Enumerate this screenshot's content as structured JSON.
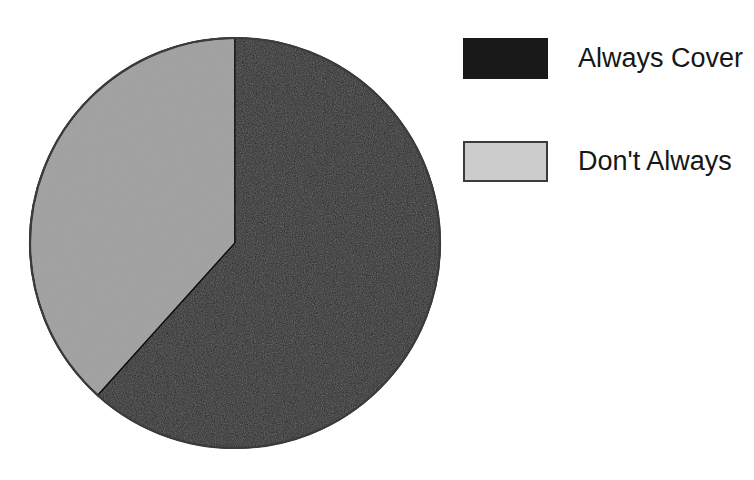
{
  "figure": {
    "background": "#ffffff",
    "width": 754,
    "height": 480
  },
  "chart_data": {
    "type": "pie",
    "title": "",
    "subtitle": "",
    "xlabel": "",
    "ylabel": "",
    "grid": false,
    "legend_position": "right",
    "categories": [
      "Always Cover",
      "Don't Always"
    ],
    "values": [
      61.7,
      38.3
    ],
    "units": "percent",
    "start_angle_deg": 0,
    "direction": "clockwise",
    "slices": [
      {
        "label": "Always Cover",
        "value": 61.7,
        "color": "#191919",
        "start_angle_deg": 0,
        "end_angle_deg": 222,
        "sweep_deg": 222
      },
      {
        "label": "Don't Always",
        "value": 38.3,
        "color": "#cccccc",
        "start_angle_deg": 222,
        "end_angle_deg": 360,
        "sweep_deg": 138
      }
    ],
    "geometry": {
      "center_x": 235,
      "center_y": 243,
      "radius": 205,
      "outline_color": "#3b3b3b"
    }
  },
  "legend": {
    "items": [
      {
        "label": "Always Cover",
        "swatch_name": "legend-swatch-always-cover",
        "color": "#191919",
        "style": "dark"
      },
      {
        "label": "Don't Always",
        "swatch_name": "legend-swatch-dont-always",
        "color": "#cccccc",
        "style": "light"
      }
    ]
  }
}
